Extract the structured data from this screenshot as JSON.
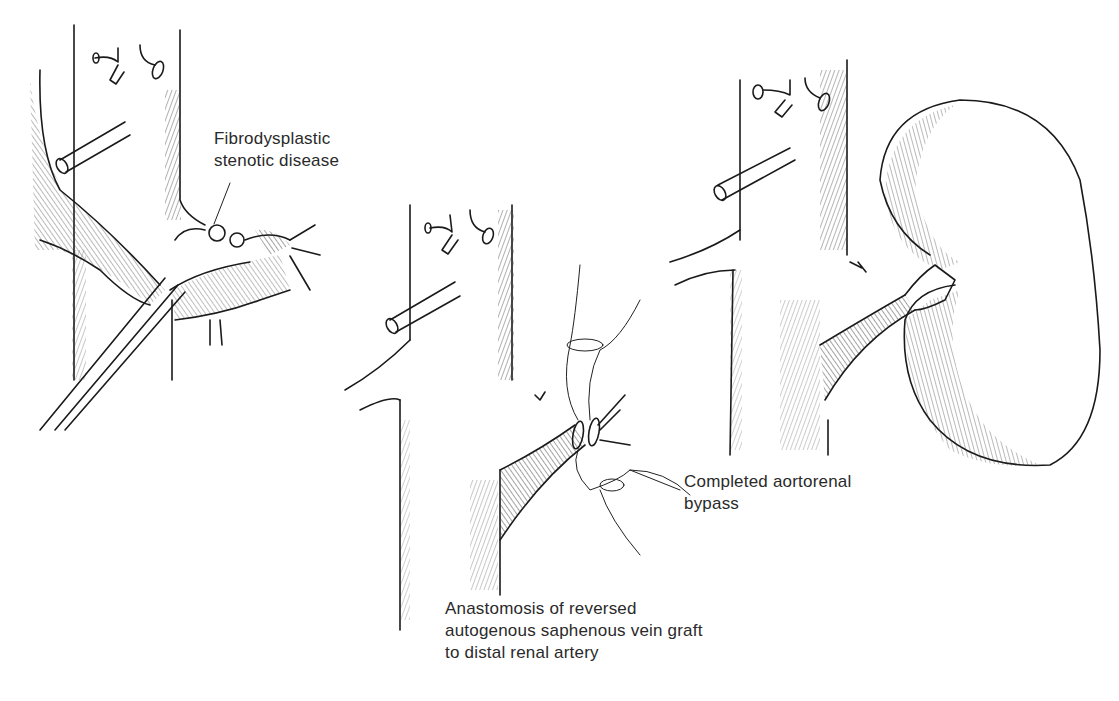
{
  "figure": {
    "background": "#ffffff",
    "ink_color": "#1a1a1a",
    "text_color": "#2a2a2a",
    "panels": [
      {
        "id": "panel-1",
        "description": "Aorta with renal artery showing stenotic beading; clamp applied",
        "label": {
          "lines": [
            "Fibrodysplastic",
            "stenotic disease"
          ]
        }
      },
      {
        "id": "panel-2",
        "description": "Vein graft sutured to distal renal artery with stay sutures",
        "label": {
          "lines": [
            "Anastomosis of reversed",
            "autogenous saphenous vein graft",
            "to distal renal artery"
          ]
        }
      },
      {
        "id": "panel-3",
        "description": "Aorta with completed bypass graft to kidney",
        "label": {
          "lines": [
            "Completed aortorenal",
            "bypass"
          ]
        }
      }
    ]
  }
}
